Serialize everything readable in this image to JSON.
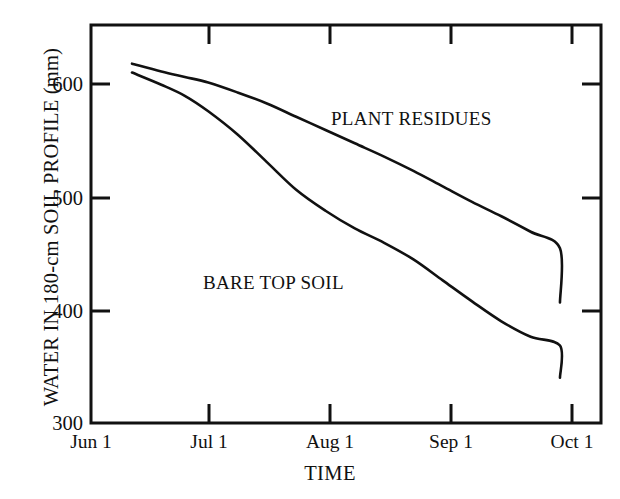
{
  "chart_data": {
    "type": "line",
    "title": "",
    "xlabel": "TIME",
    "ylabel": "WATER IN 180-cm SOIL PROFILE (mm)",
    "xticklabels": [
      "Jun 1",
      "Jul 1",
      "Aug 1",
      "Sep 1",
      "Oct 1"
    ],
    "yticklabels": [
      "600",
      "500",
      "400",
      "300"
    ],
    "ylim": [
      300,
      660
    ],
    "xlim": [
      0,
      4.35
    ],
    "grid": false,
    "legend_position": "inline-annotation",
    "line_color": "#111111",
    "background_color": "#ffffff",
    "series": [
      {
        "name": "PLANT RESIDUES",
        "label_position": "inline",
        "x": [
          0.35,
          0.6,
          0.8,
          1.0,
          1.25,
          1.5,
          1.75,
          2.0,
          2.25,
          2.5,
          2.75,
          3.0,
          3.25,
          3.5,
          3.75,
          4.0
        ],
        "values": [
          625,
          618,
          613,
          608,
          599,
          589,
          577,
          565,
          553,
          541,
          528,
          514,
          500,
          487,
          473,
          458
        ]
      },
      {
        "name": "BARE TOP SOIL",
        "label_position": "inline",
        "x": [
          0.35,
          0.6,
          0.8,
          1.0,
          1.25,
          1.5,
          1.75,
          2.0,
          2.25,
          2.5,
          2.75,
          3.0,
          3.25,
          3.5,
          3.75,
          4.0
        ],
        "values": [
          617,
          606,
          596,
          582,
          561,
          536,
          511,
          492,
          476,
          463,
          448,
          429,
          410,
          392,
          378,
          370
        ]
      }
    ],
    "series_extended": [
      {
        "name": "PLANT RESIDUES",
        "x_end": 4.0,
        "values_end": 409
      },
      {
        "name": "BARE TOP SOIL",
        "x_end": 4.0,
        "values_end": 341
      }
    ]
  },
  "annotations": {
    "plant_residues": "PLANT RESIDUES",
    "bare_top_soil": "BARE TOP SOIL"
  },
  "axes": {
    "y_label": "WATER IN 180-cm SOIL PROFILE (mm)",
    "x_label": "TIME",
    "y_ticks": [
      {
        "label": "600"
      },
      {
        "label": "500"
      },
      {
        "label": "400"
      },
      {
        "label": "300"
      }
    ],
    "x_ticks": [
      {
        "label": "Jun 1"
      },
      {
        "label": "Jul 1"
      },
      {
        "label": "Aug 1"
      },
      {
        "label": "Sep 1"
      },
      {
        "label": "Oct 1"
      }
    ]
  }
}
